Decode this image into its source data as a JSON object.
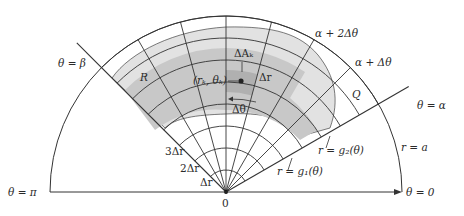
{
  "figure": {
    "colors": {
      "background": "#ffffff",
      "region_light": "#e2e2e2",
      "region_dark": "#c8c8c8",
      "highlight_cell": "#b4b4b4",
      "lines": "#333333"
    },
    "geometry": {
      "origin": [
        226,
        192
      ],
      "outer_radius_a": 176,
      "alpha_deg": 30,
      "beta_deg": 135,
      "delta_theta_deg": 15,
      "delta_r": 22,
      "num_radial_steps": 8
    }
  },
  "labels": {
    "theta_beta": "θ = β",
    "theta_alpha": "θ = α",
    "theta_pi": "θ = π",
    "theta_zero": "θ = 0",
    "alpha_plus_2dtheta": "α + 2Δθ",
    "alpha_plus_dtheta": "α + Δθ",
    "region_R": "R",
    "region_Q": "Q",
    "delta_A_k": "ΔAₖ",
    "point_rk_thetak": "(rₖ, θₖ)",
    "delta_r_cell": "Δr",
    "delta_theta_cell": "Δθ",
    "r_eq_a": "r = a",
    "r_eq_g2": "r = g₂(θ)",
    "r_eq_g1": "r = g₁(θ)",
    "three_delta_r": "3Δr",
    "two_delta_r": "2Δr",
    "one_delta_r": "Δr",
    "origin": "0"
  }
}
